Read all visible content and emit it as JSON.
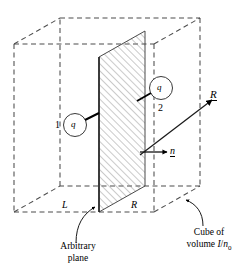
{
  "figure": {
    "background_color": "#ffffff",
    "line_color": "#000000",
    "dash_color": "#555555",
    "hatch_color": "#777777"
  },
  "cube": {
    "description": "dashed wireframe cube drawn in oblique projection",
    "style": "dashed",
    "edge_labels": {
      "left_bottom": "L",
      "right_bottom": "R"
    }
  },
  "plane": {
    "fill": "hatched",
    "hatch_direction": "diagonal-up-right",
    "caption_line_1": "Arbitrary",
    "caption_line_2": "plane"
  },
  "particles": [
    {
      "id": "particle-1",
      "number_label": "1",
      "symbol": "q",
      "side": "left"
    },
    {
      "id": "particle-2",
      "number_label": "2",
      "symbol": "q",
      "side": "right"
    }
  ],
  "vectors": [
    {
      "id": "normal-vector",
      "label": "n",
      "notation": "underlined",
      "direction": "right"
    },
    {
      "id": "position-vector-R",
      "label": "R",
      "notation": "underlined",
      "direction": "up-right"
    }
  ],
  "annotations": {
    "cube_caption_line_1": "Cube of",
    "cube_caption_line_2_prefix": "volume ",
    "cube_caption_numerator": "I",
    "cube_caption_slash": "/",
    "cube_caption_denominator": "n",
    "cube_caption_subscript": "0"
  }
}
